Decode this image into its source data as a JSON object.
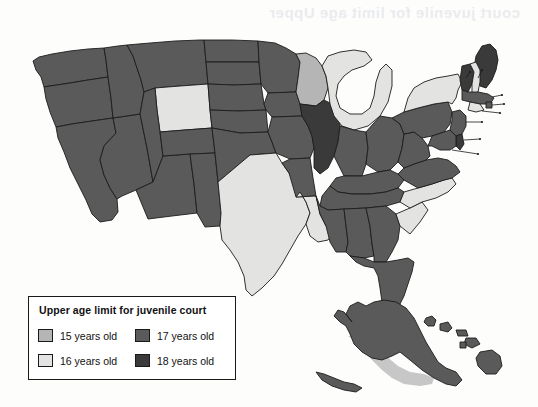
{
  "page": {
    "bleed_through_text": "court juvenile for limit age Upper"
  },
  "legend": {
    "title": "Upper age limit for juvenile court",
    "items": [
      {
        "label": "15 years old",
        "color": "#b5b5b5",
        "swatch_name": "legend-swatch-15"
      },
      {
        "label": "17 years old",
        "color": "#5a5a5a",
        "swatch_name": "legend-swatch-17"
      },
      {
        "label": "16 years old",
        "color": "#e3e3e1",
        "swatch_name": "legend-swatch-16"
      },
      {
        "label": "18 years old",
        "color": "#3a3a3a",
        "swatch_name": "legend-swatch-18"
      }
    ]
  },
  "map": {
    "title": "Upper age limit for juvenile court",
    "colors": {
      "age15": "#b5b5b5",
      "age16": "#e3e3e1",
      "age17": "#5a5a5a",
      "age18": "#3a3a3a",
      "border": "#1c1c1c"
    },
    "state_labels": [
      "VT",
      "NH",
      "MA",
      "RI",
      "CT",
      "NJ",
      "DE",
      "MD"
    ],
    "states": {
      "WA": "age17",
      "OR": "age17",
      "CA": "age17",
      "NV": "age17",
      "ID": "age17",
      "MT": "age17",
      "WY": "age16",
      "UT": "age17",
      "AZ": "age17",
      "CO": "age17",
      "NM": "age17",
      "ND": "age17",
      "SD": "age17",
      "NE": "age17",
      "KS": "age17",
      "OK": "age17",
      "TX": "age16",
      "MN": "age17",
      "IA": "age17",
      "MO": "age17",
      "AR": "age17",
      "LA": "age16",
      "WI": "age15",
      "IL": "age18",
      "MI": "age16",
      "IN": "age17",
      "OH": "age17",
      "KY": "age17",
      "TN": "age17",
      "MS": "age17",
      "AL": "age17",
      "GA": "age17",
      "FL": "age17",
      "SC": "age16",
      "NC": "age16",
      "VA": "age17",
      "WV": "age17",
      "PA": "age17",
      "NY": "age16",
      "ME": "age18",
      "VT": "age18",
      "NH": "age16",
      "MA": "age17",
      "RI": "age17",
      "CT": "age16",
      "NJ": "age17",
      "DE": "age18",
      "MD": "age17",
      "AK": "age17",
      "HI": "age17"
    }
  }
}
